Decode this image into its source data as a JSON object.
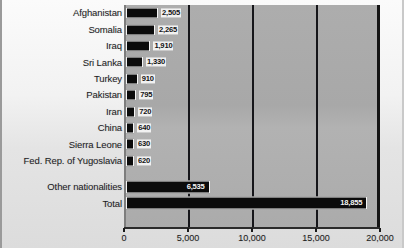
{
  "chart_data": {
    "type": "bar",
    "orientation": "horizontal",
    "title": "",
    "xlabel": "",
    "ylabel": "",
    "xlim": [
      0,
      20000
    ],
    "grid": true,
    "legend": false,
    "categories": [
      "Afghanistan",
      "Somalia",
      "Iraq",
      "Sri Lanka",
      "Turkey",
      "Pakistan",
      "Iran",
      "China",
      "Sierra Leone",
      "Fed. Rep. of Yugoslavia",
      "Other nationalities",
      "Total"
    ],
    "values": [
      2505,
      2265,
      1910,
      1330,
      910,
      795,
      720,
      640,
      630,
      620,
      6535,
      18855
    ],
    "value_labels": [
      "2,505",
      "2,265",
      "1,910",
      "1,330",
      "910",
      "795",
      "720",
      "640",
      "630",
      "620",
      "6,535",
      "18,855"
    ],
    "xticks": [
      0,
      5000,
      10000,
      15000,
      20000
    ],
    "xtick_labels": [
      "0",
      "5,000",
      "10,000",
      "15,000",
      "20,000"
    ],
    "colors": {
      "bar": "#0b0b0b",
      "bar_outline": "#f4f4f4",
      "plot_background": "#ababab",
      "gridline": "#16161a",
      "page_background": "#f2f2f2",
      "text": "#1d1d1f"
    }
  }
}
